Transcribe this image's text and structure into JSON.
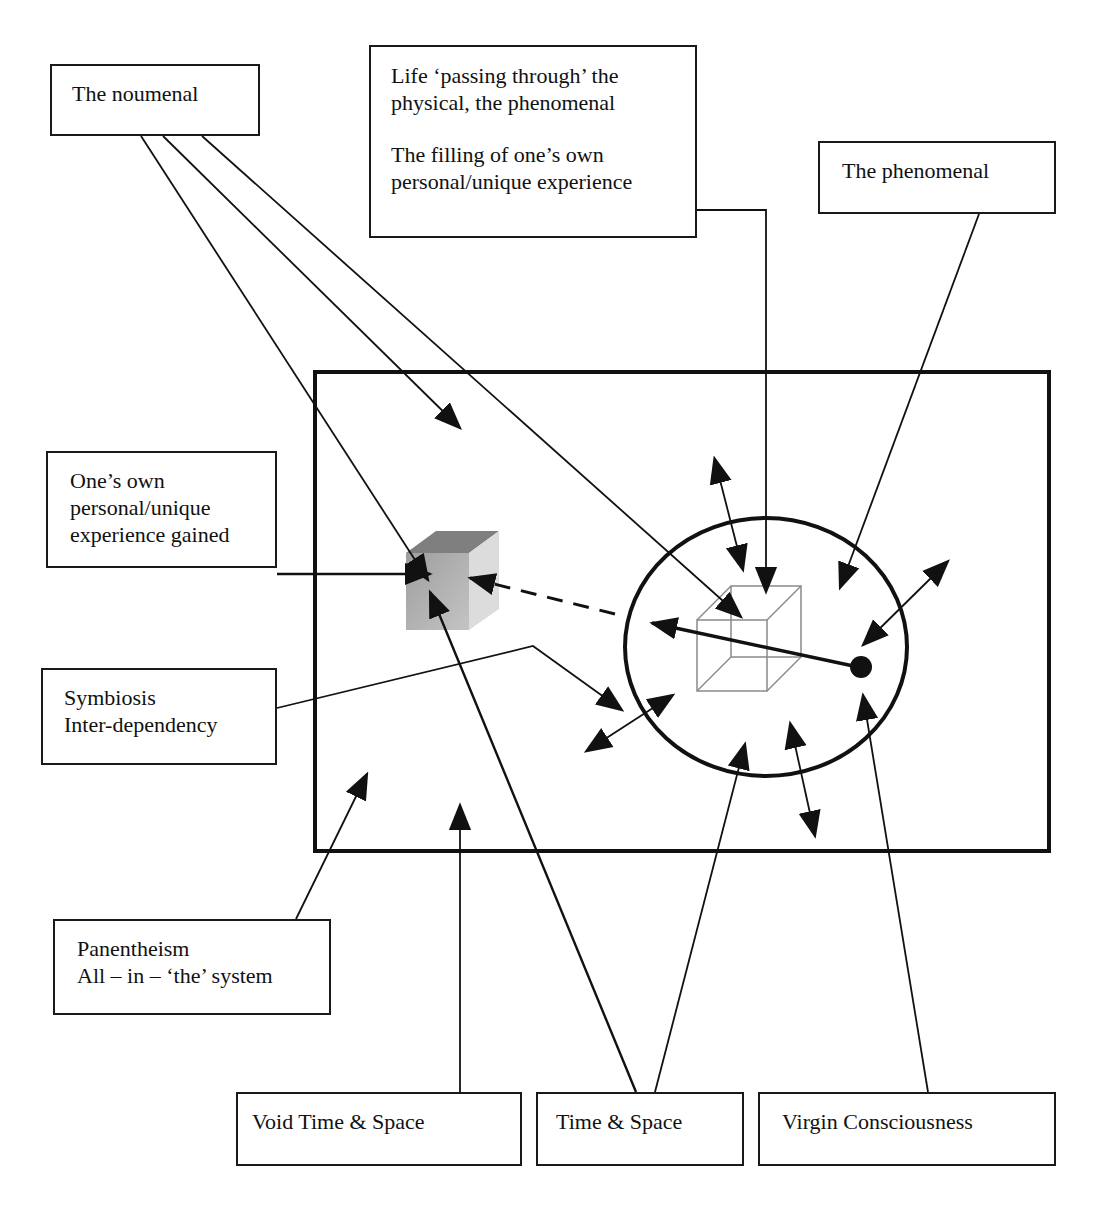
{
  "diagram": {
    "type": "conceptual-diagram",
    "colors": {
      "stroke": "#1a1a1a",
      "background": "#ffffff",
      "solid_cube_top": "#7d7d7d",
      "solid_cube_front": "#ababab",
      "solid_cube_side": "#d9d9d9",
      "wire_cube": "#8a8a8a"
    },
    "labels": {
      "noumenal": {
        "lines": [
          "The noumenal"
        ]
      },
      "life": {
        "lines": [
          "Life ‘passing through’ the",
          "physical, the phenomenal",
          "",
          "The filling of one’s own",
          "personal/unique experience"
        ]
      },
      "phenomenal": {
        "lines": [
          "The phenomenal"
        ]
      },
      "gained": {
        "lines": [
          "One’s own",
          "personal/unique",
          "experience gained"
        ]
      },
      "symbiosis": {
        "lines": [
          "Symbiosis",
          "Inter-dependency"
        ]
      },
      "panentheism": {
        "lines": [
          "Panentheism",
          "All – in – ‘the’ system"
        ]
      },
      "void": {
        "lines": [
          "Void Time & Space"
        ]
      },
      "timespace": {
        "lines": [
          "Time & Space"
        ]
      },
      "virgin": {
        "lines": [
          "Virgin Consciousness"
        ]
      }
    },
    "elements": {
      "outer_system_rectangle": "Void / overall system frame",
      "circle": "Time & Space sphere of experience",
      "wire_cube": "the physical, the phenomenal",
      "solid_cube": "personal/unique experience gained",
      "dot": "virgin consciousness point"
    }
  }
}
